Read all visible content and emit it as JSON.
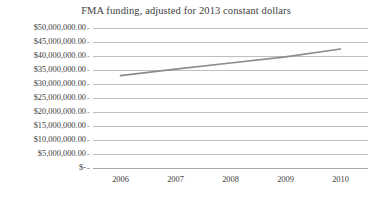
{
  "chart_data": {
    "type": "line",
    "title": "FMA funding, adjusted for 2013 constant dollars",
    "xlabel": "",
    "ylabel": "",
    "categories": [
      "2006",
      "2007",
      "2008",
      "2009",
      "2010"
    ],
    "series": [
      {
        "name": "FMA funding",
        "values": [
          33000000,
          35300000,
          37500000,
          39700000,
          42500000
        ],
        "color": "#8c8c8c"
      }
    ],
    "ylim": [
      0,
      50000000
    ],
    "ytick_values": [
      0,
      5000000,
      10000000,
      15000000,
      20000000,
      25000000,
      30000000,
      35000000,
      40000000,
      45000000,
      50000000
    ],
    "ytick_labels": [
      "$-",
      "$5,000,000.00",
      "$10,000,000.00",
      "$15,000,000.00",
      "$20,000,000.00",
      "$25,000,000.00",
      "$30,000,000.00",
      "$35,000,000.00",
      "$40,000,000.00",
      "$45,000,000.00",
      "$50,000,000.00"
    ],
    "grid": true,
    "grid_color": "#bfbfbf",
    "legend": false,
    "legend_position": "none",
    "axis_color": "#a6a6a6",
    "text_color": "#404040",
    "background": "#ffffff"
  }
}
